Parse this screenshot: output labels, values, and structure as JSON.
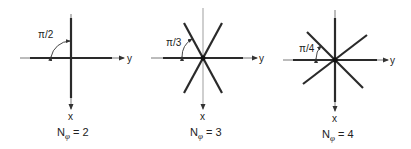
{
  "panels": [
    {
      "angle_label": "π/2",
      "x_label": "x",
      "y_label": "y",
      "caption_main": "N",
      "caption_sub": "φ",
      "caption_rest": " = 2",
      "n_phi": 2
    },
    {
      "angle_label": "π/3",
      "x_label": "x",
      "y_label": "y",
      "caption_main": "N",
      "caption_sub": "φ",
      "caption_rest": " = 3",
      "n_phi": 3
    },
    {
      "angle_label": "π/4",
      "x_label": "x",
      "y_label": "y",
      "caption_main": "N",
      "caption_sub": "φ",
      "caption_rest": " = 4",
      "n_phi": 4
    }
  ],
  "colors": {
    "line": "#2a2a2a",
    "axis": "#555555"
  }
}
